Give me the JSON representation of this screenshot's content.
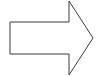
{
  "canvas": {
    "width": 97,
    "height": 76,
    "background_color": "#ffffff"
  },
  "diagram": {
    "type": "block-arrow",
    "title": "",
    "shapes": [
      {
        "name": "right-block-arrow",
        "direction": "right",
        "fill_color": "#ffffff",
        "stroke_color": "#3b3b3f",
        "stroke_width": 1,
        "points": "10,22 69,22 69,1 93,38 69,75 69,54 10,54",
        "vertices": [
          {
            "label": "shaft-top-left",
            "x": 10,
            "y": 22
          },
          {
            "label": "shaft-top-right",
            "x": 69,
            "y": 22
          },
          {
            "label": "head-top-corner",
            "x": 69,
            "y": 1
          },
          {
            "label": "head-tip",
            "x": 93,
            "y": 38
          },
          {
            "label": "head-bottom-corner",
            "x": 69,
            "y": 75
          },
          {
            "label": "shaft-bottom-right",
            "x": 69,
            "y": 54
          },
          {
            "label": "shaft-bottom-left",
            "x": 10,
            "y": 54
          }
        ]
      }
    ]
  }
}
